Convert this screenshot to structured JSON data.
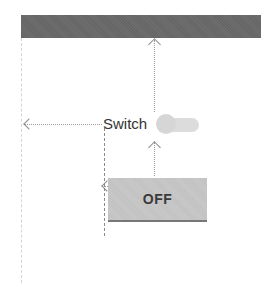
{
  "diagram": {
    "top_bar": {
      "label": "",
      "color": "#6e6e6e"
    },
    "switch": {
      "label": "Switch",
      "state": "off",
      "track_color": "#dcdcdc",
      "thumb_color": "#d6d6d6"
    },
    "toggle_button": {
      "label": "OFF",
      "background": "#c9c9c9",
      "underline_color": "#777777"
    },
    "constraints": [
      {
        "from": "switch",
        "to": "top_bar",
        "direction": "up"
      },
      {
        "from": "switch",
        "to": "parent_left",
        "direction": "left"
      },
      {
        "from": "toggle_button",
        "to": "switch",
        "direction": "up"
      },
      {
        "from": "toggle_button",
        "to": "switch_left_guide",
        "direction": "left"
      }
    ]
  }
}
